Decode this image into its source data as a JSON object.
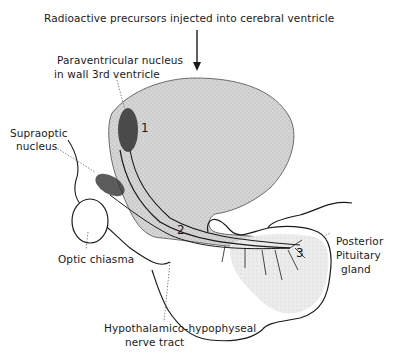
{
  "diagram": {
    "title_annotation": "Radioactive precursors injected into cerebral ventricle",
    "labels": {
      "paraventricular_line1": "Paraventricular nucleus",
      "paraventricular_line2": "in wall 3rd ventricle",
      "supraoptic_line1": "Supraoptic",
      "supraoptic_line2": "nucleus",
      "optic_chiasma": "Optic chiasma",
      "posterior_line1": "Posterior",
      "posterior_line2": "Pituitary",
      "posterior_line3": "gland",
      "tract_line1": "Hypothalamico-hypophyseal",
      "tract_line2": "nerve tract"
    },
    "markers": [
      "1",
      "2",
      "3"
    ],
    "colors": {
      "ink": "#1a1a1a",
      "ventricle_fill": "#d4d4d4",
      "gland_fill": "#e6e6e6",
      "tract_fill": "#b8b8b8",
      "background": "#ffffff"
    }
  }
}
